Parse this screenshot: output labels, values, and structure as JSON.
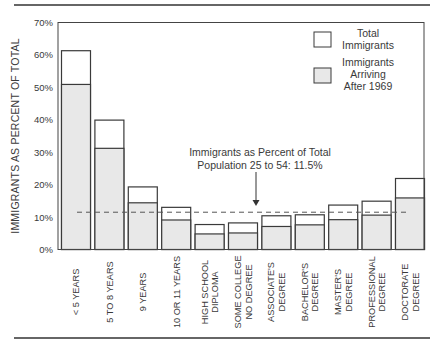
{
  "chart_data": {
    "type": "bar",
    "title": "",
    "xlabel": "",
    "ylabel": "IMMIGRANTS AS PERCENT OF TOTAL",
    "ylim": [
      0,
      70
    ],
    "yticks": [
      "0%",
      "10%",
      "20%",
      "30%",
      "40%",
      "50%",
      "60%",
      "70%"
    ],
    "categories": [
      [
        "< 5 YEARS"
      ],
      [
        "5 TO 8 YEARS"
      ],
      [
        "9 YEARS"
      ],
      [
        "10 OR 11 YEARS"
      ],
      [
        "HIGH SCHOOL",
        "DIPLOMA"
      ],
      [
        "SOME COLLEGE",
        "NO DEGREE"
      ],
      [
        "ASSOCIATE'S",
        "DEGREE"
      ],
      [
        "BACHELOR'S",
        "DEGREE"
      ],
      [
        "MASTER'S",
        "DEGREE"
      ],
      [
        "PROFESSIONAL",
        "DEGREE"
      ],
      [
        "DOCTORATE",
        "DEGREE"
      ]
    ],
    "series": [
      {
        "name": "Total Immigrants",
        "color": "#ffffff",
        "values": [
          61.3,
          39.9,
          19.3,
          13.0,
          7.7,
          8.2,
          10.4,
          10.7,
          13.7,
          14.9,
          21.9
        ]
      },
      {
        "name": "Immigrants Arriving After 1969",
        "color": "#e8e8e8",
        "values": [
          50.9,
          31.2,
          14.4,
          9.1,
          4.8,
          5.1,
          7.1,
          7.6,
          9.2,
          10.6,
          15.9
        ]
      }
    ],
    "legend": {
      "position": "upper right",
      "entries": [
        {
          "lines": [
            "Total",
            "Immigrants"
          ],
          "fill": "#ffffff"
        },
        {
          "lines": [
            "Immigrants",
            "Arriving",
            "After 1969"
          ],
          "fill": "#e8e8e8"
        }
      ]
    },
    "reference_line": {
      "value": 11.5,
      "style": "dashed",
      "annotation": [
        "Immigrants as Percent of Total",
        "Population 25 to 54:  11.5%"
      ]
    },
    "grid": false
  }
}
